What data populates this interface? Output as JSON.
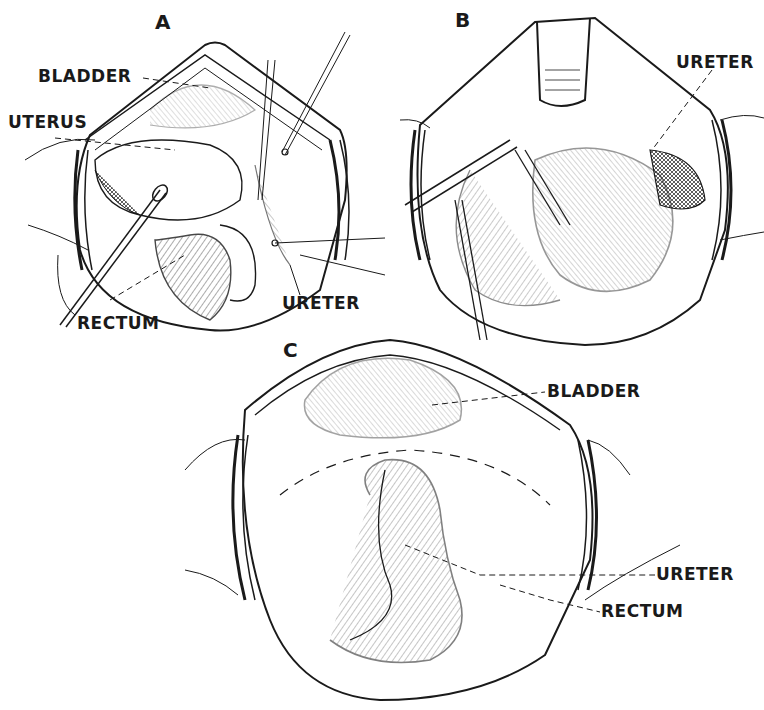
{
  "figure": {
    "type": "surgical illustration",
    "panels": [
      {
        "id": "A",
        "letter": "A",
        "labels": [
          {
            "key": "bladder",
            "text": "BLADDER"
          },
          {
            "key": "uterus",
            "text": "UTERUS"
          },
          {
            "key": "rectum",
            "text": "RECTUM"
          },
          {
            "key": "ureter",
            "text": "URETER"
          }
        ]
      },
      {
        "id": "B",
        "letter": "B",
        "labels": [
          {
            "key": "ureter",
            "text": "URETER"
          }
        ]
      },
      {
        "id": "C",
        "letter": "C",
        "labels": [
          {
            "key": "bladder",
            "text": "BLADDER"
          },
          {
            "key": "ureter",
            "text": "URETER"
          },
          {
            "key": "rectum",
            "text": "RECTUM"
          }
        ]
      }
    ],
    "colors": {
      "ink": "#1a1a1a",
      "paper": "#ffffff"
    }
  }
}
